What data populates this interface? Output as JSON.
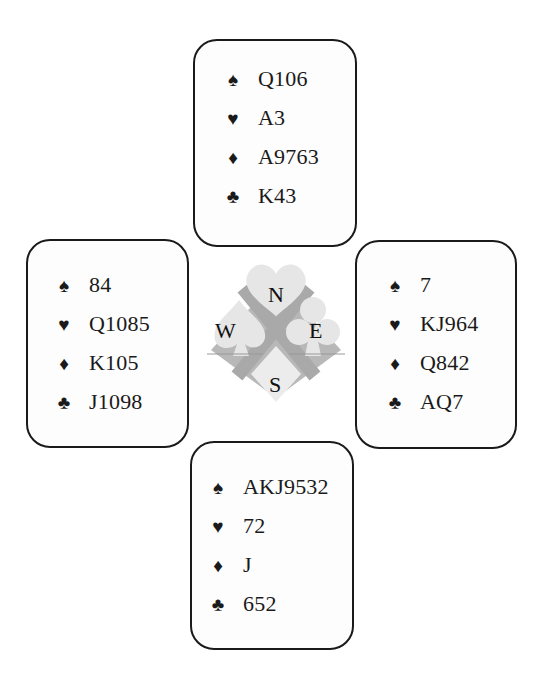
{
  "diagram": "Bridge deal diagram",
  "suit_symbols": {
    "spades": "♠",
    "hearts": "♥",
    "diamonds": "♦",
    "clubs": "♣"
  },
  "compass": {
    "north": "N",
    "south": "S",
    "east": "E",
    "west": "W"
  },
  "hands": {
    "north": {
      "spades": "Q106",
      "hearts": "A3",
      "diamonds": "A9763",
      "clubs": "K43"
    },
    "west": {
      "spades": "84",
      "hearts": "Q1085",
      "diamonds": "K105",
      "clubs": "J1098"
    },
    "east": {
      "spades": "7",
      "hearts": "KJ964",
      "diamonds": "Q842",
      "clubs": "AQ7"
    },
    "south": {
      "spades": "AKJ9532",
      "hearts": "72",
      "diamonds": "J",
      "clubs": "652"
    }
  },
  "colors": {
    "ink": "#1a1a1a",
    "compass_light": "#e4e4e4",
    "compass_dark": "#b3b3b3"
  }
}
